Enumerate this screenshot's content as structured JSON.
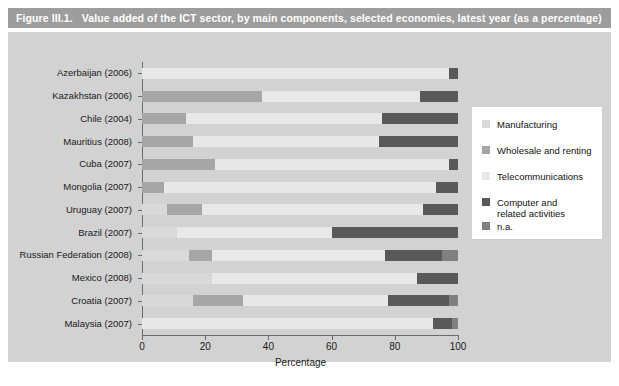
{
  "figure": {
    "number": "Figure III.1.",
    "title": "Value added of the ICT sector, by main components, selected economies, latest year (as a percentage)"
  },
  "colors": {
    "title_bar_bg": "#9d9d9d",
    "panel_bg": "#d2d2d2",
    "legend_bg": "#ffffff",
    "manufacturing": "#d9d9d9",
    "wholesale": "#a6a6a6",
    "telecommunications": "#e8e8e8",
    "computer": "#595959",
    "na": "#808080",
    "axis": "#6b6b6b",
    "text": "#1a1a1a"
  },
  "chart_data": {
    "type": "bar",
    "orientation": "horizontal",
    "stacked": true,
    "title": "Value added of the ICT sector, by main components, selected economies, latest year (as a percentage)",
    "xlabel": "Percentage",
    "ylabel": "",
    "xlim": [
      0,
      100
    ],
    "xticks": [
      0,
      20,
      40,
      60,
      80,
      100
    ],
    "grid": false,
    "legend_position": "right",
    "categories": [
      "Azerbaijan (2006)",
      "Kazakhstan (2006)",
      "Chile (2004)",
      "Mauritius (2008)",
      "Cuba (2007)",
      "Mongolia (2007)",
      "Uruguay (2007)",
      "Brazil (2007)",
      "Russian Federation (2008)",
      "Mexico (2008)",
      "Croatia (2007)",
      "Malaysia (2007)"
    ],
    "series": [
      {
        "name": "Manufacturing",
        "color": "#d9d9d9",
        "values": [
          0,
          0,
          0,
          0,
          0,
          0,
          8,
          11,
          15,
          22,
          16,
          0
        ]
      },
      {
        "name": "Wholesale and renting",
        "color": "#a6a6a6",
        "values": [
          0,
          38,
          14,
          16,
          23,
          7,
          11,
          0,
          7,
          0,
          16,
          0
        ]
      },
      {
        "name": "Telecommunications",
        "color": "#e8e8e8",
        "values": [
          97,
          50,
          62,
          59,
          74,
          86,
          70,
          49,
          55,
          65,
          46,
          92
        ]
      },
      {
        "name": "Computer and related activities",
        "color": "#595959",
        "values": [
          3,
          12,
          24,
          25,
          3,
          7,
          11,
          40,
          18,
          13,
          19,
          6
        ]
      },
      {
        "name": "n.a.",
        "color": "#808080",
        "values": [
          0,
          0,
          0,
          0,
          0,
          0,
          0,
          0,
          5,
          0,
          3,
          2
        ]
      }
    ],
    "legend_entries": [
      "Manufacturing",
      "Wholesale and renting",
      "Telecommunications",
      "Computer and\nrelated activities",
      "n.a."
    ]
  }
}
